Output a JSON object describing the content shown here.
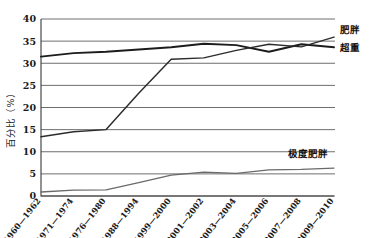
{
  "chart_data": {
    "type": "line",
    "title": "",
    "xlabel": "",
    "ylabel": "百分比（%）",
    "ylim": [
      0,
      40
    ],
    "ytick_step": 5,
    "yticks": [
      "0",
      "5",
      "10",
      "15",
      "20",
      "25",
      "30",
      "35",
      "40"
    ],
    "grid": true,
    "legend_position": "right-inline-labels",
    "categories": [
      "1960—1962",
      "1971—1974",
      "1976—1980",
      "1988—1994",
      "1999—2000",
      "2001—2002",
      "2003—2004",
      "2005—2006",
      "2007—2008",
      "2009—2010"
    ],
    "series": [
      {
        "name": "超重",
        "label": "超重",
        "color": "#1c1c1c",
        "values": [
          31.5,
          32.3,
          32.6,
          33.1,
          33.6,
          34.4,
          34.1,
          32.6,
          34.3,
          33.6
        ]
      },
      {
        "name": "肥胖",
        "label": "肥胖",
        "color": "#2b2b2b",
        "values": [
          13.4,
          14.5,
          15.0,
          23.2,
          30.9,
          31.2,
          32.9,
          34.3,
          33.7,
          35.9
        ]
      },
      {
        "name": "极度肥胖",
        "label": "极度肥胖",
        "color": "#6a6a6a",
        "values": [
          0.9,
          1.3,
          1.4,
          3.0,
          4.7,
          5.4,
          5.1,
          5.9,
          6.0,
          6.3
        ]
      }
    ]
  },
  "axis": {
    "y_title": "百分比（%）"
  }
}
